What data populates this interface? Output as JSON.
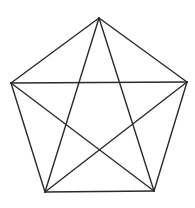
{
  "diagram": {
    "background": "#ffffff",
    "stroke_color": "#2b2b2b",
    "stroke_width": 1.4,
    "vertices": [
      {
        "id": "A",
        "position": "top",
        "x": 99,
        "y": 18
      },
      {
        "id": "B",
        "position": "right",
        "x": 187,
        "y": 82
      },
      {
        "id": "C",
        "position": "bottom-right",
        "x": 154,
        "y": 191
      },
      {
        "id": "D",
        "position": "bottom-left",
        "x": 45,
        "y": 192
      },
      {
        "id": "E",
        "position": "left",
        "x": 11,
        "y": 83
      }
    ],
    "edges": [
      {
        "name": "pentagon-edge-AB",
        "from": "A",
        "to": "B"
      },
      {
        "name": "pentagon-edge-BC",
        "from": "B",
        "to": "C"
      },
      {
        "name": "pentagon-edge-CD",
        "from": "C",
        "to": "D"
      },
      {
        "name": "pentagon-edge-DE",
        "from": "D",
        "to": "E"
      },
      {
        "name": "pentagon-edge-EA",
        "from": "E",
        "to": "A"
      }
    ],
    "diagonals": [
      {
        "name": "diagonal-AC",
        "from": "A",
        "to": "C"
      },
      {
        "name": "diagonal-AD",
        "from": "A",
        "to": "D"
      },
      {
        "name": "diagonal-BD",
        "from": "B",
        "to": "D"
      },
      {
        "name": "diagonal-BE",
        "from": "B",
        "to": "E"
      },
      {
        "name": "diagonal-CE",
        "from": "C",
        "to": "E"
      }
    ]
  }
}
